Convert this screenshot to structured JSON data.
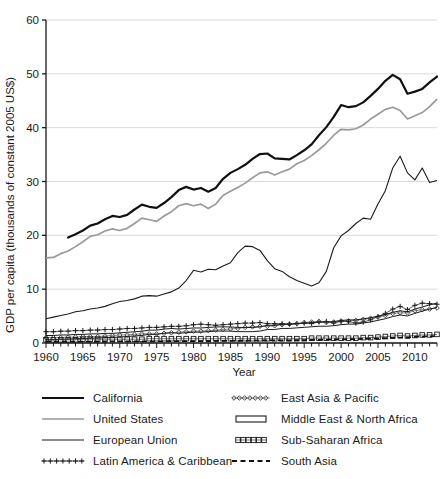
{
  "chart_data": {
    "type": "line",
    "title": "",
    "xlabel": "Year",
    "ylabel": "GDP per capita (thousands of constant 2005 US$)",
    "xlim": [
      1960,
      2013
    ],
    "ylim": [
      0,
      60
    ],
    "yticks": [
      0,
      10,
      20,
      30,
      40,
      50,
      60
    ],
    "xticks": [
      1960,
      1965,
      1970,
      1975,
      1980,
      1985,
      1990,
      1995,
      2000,
      2005,
      2010
    ],
    "xtick_step_minor": 1,
    "grid": "horizontal",
    "legend_position": "below-plot-two-columns",
    "series": [
      {
        "name": "California",
        "style": "solid-thick-black",
        "color": "#111111",
        "x": [
          1963,
          1964,
          1965,
          1966,
          1967,
          1968,
          1969,
          1970,
          1971,
          1972,
          1973,
          1974,
          1975,
          1976,
          1977,
          1978,
          1979,
          1980,
          1981,
          1982,
          1983,
          1984,
          1985,
          1986,
          1987,
          1988,
          1989,
          1990,
          1991,
          1992,
          1993,
          1994,
          1995,
          1996,
          1997,
          1998,
          1999,
          2000,
          2001,
          2002,
          2003,
          2004,
          2005,
          2006,
          2007,
          2008,
          2009,
          2010,
          2011,
          2012,
          2013
        ],
        "values": [
          19.6,
          20.2,
          20.9,
          21.8,
          22.2,
          23.0,
          23.6,
          23.4,
          23.8,
          24.8,
          25.7,
          25.3,
          25.1,
          26.0,
          27.1,
          28.4,
          29.0,
          28.5,
          28.8,
          28.1,
          28.8,
          30.5,
          31.6,
          32.3,
          33.1,
          34.2,
          35.1,
          35.2,
          34.3,
          34.2,
          34.1,
          34.9,
          35.8,
          36.9,
          38.6,
          40.1,
          42.0,
          44.2,
          43.8,
          44.0,
          44.7,
          45.9,
          47.2,
          48.7,
          49.8,
          49.0,
          46.3,
          46.7,
          47.2,
          48.4,
          49.5
        ]
      },
      {
        "name": "United States",
        "style": "solid-gray",
        "color": "#9a9a9a",
        "x": [
          1960,
          1961,
          1962,
          1963,
          1964,
          1965,
          1966,
          1967,
          1968,
          1969,
          1970,
          1971,
          1972,
          1973,
          1974,
          1975,
          1976,
          1977,
          1978,
          1979,
          1980,
          1981,
          1982,
          1983,
          1984,
          1985,
          1986,
          1987,
          1988,
          1989,
          1990,
          1991,
          1992,
          1993,
          1994,
          1995,
          1996,
          1997,
          1998,
          1999,
          2000,
          2001,
          2002,
          2003,
          2004,
          2005,
          2006,
          2007,
          2008,
          2009,
          2010,
          2011,
          2012,
          2013
        ],
        "values": [
          15.8,
          15.9,
          16.6,
          17.1,
          17.9,
          18.8,
          19.8,
          20.1,
          20.8,
          21.2,
          20.9,
          21.3,
          22.2,
          23.2,
          22.9,
          22.6,
          23.6,
          24.4,
          25.5,
          25.9,
          25.5,
          25.8,
          25.0,
          25.8,
          27.4,
          28.2,
          28.9,
          29.7,
          30.7,
          31.6,
          31.8,
          31.2,
          31.8,
          32.3,
          33.3,
          33.9,
          34.8,
          35.9,
          37.1,
          38.6,
          39.7,
          39.6,
          39.8,
          40.5,
          41.6,
          42.5,
          43.4,
          43.8,
          43.2,
          41.6,
          42.2,
          42.8,
          43.9,
          45.3
        ]
      },
      {
        "name": "European Union",
        "style": "solid-thin-black",
        "color": "#1a1a1a",
        "x": [
          1960,
          1961,
          1962,
          1963,
          1964,
          1965,
          1966,
          1967,
          1968,
          1969,
          1970,
          1971,
          1972,
          1973,
          1974,
          1975,
          1976,
          1977,
          1978,
          1979,
          1980,
          1981,
          1982,
          1983,
          1984,
          1985,
          1986,
          1987,
          1988,
          1989,
          1990,
          1991,
          1992,
          1993,
          1994,
          1995,
          1996,
          1997,
          1998,
          1999,
          2000,
          2001,
          2002,
          2003,
          2004,
          2005,
          2006,
          2007,
          2008,
          2009,
          2010,
          2011,
          2012,
          2013
        ],
        "values": [
          4.5,
          4.8,
          5.1,
          5.4,
          5.8,
          6.0,
          6.3,
          6.5,
          6.8,
          7.3,
          7.7,
          7.9,
          8.2,
          8.7,
          8.8,
          8.7,
          9.1,
          9.5,
          10.2,
          11.6,
          13.5,
          13.2,
          13.7,
          13.6,
          14.3,
          14.9,
          16.8,
          18.0,
          17.9,
          17.2,
          15.3,
          13.8,
          13.3,
          12.3,
          11.6,
          11.1,
          10.6,
          11.2,
          13.3,
          17.7,
          19.9,
          20.9,
          22.2,
          23.2,
          23.0,
          25.8,
          28.3,
          32.5,
          34.7,
          31.6,
          30.3,
          32.5,
          29.8,
          30.2
        ]
      },
      {
        "name": "Latin America & Caribbean",
        "style": "plus-markers",
        "color": "#1a1a1a",
        "x": [
          1960,
          1961,
          1962,
          1963,
          1964,
          1965,
          1966,
          1967,
          1968,
          1969,
          1970,
          1971,
          1972,
          1973,
          1974,
          1975,
          1976,
          1977,
          1978,
          1979,
          1980,
          1981,
          1982,
          1983,
          1984,
          1985,
          1986,
          1987,
          1988,
          1989,
          1990,
          1991,
          1992,
          1993,
          1994,
          1995,
          1996,
          1997,
          1998,
          1999,
          2000,
          2001,
          2002,
          2003,
          2004,
          2005,
          2006,
          2007,
          2008,
          2009,
          2010,
          2011,
          2012,
          2013
        ],
        "values": [
          2.1,
          2.1,
          2.2,
          2.2,
          2.3,
          2.3,
          2.4,
          2.4,
          2.5,
          2.5,
          2.6,
          2.7,
          2.7,
          2.8,
          2.9,
          2.9,
          3.0,
          3.1,
          3.1,
          3.2,
          3.4,
          3.5,
          3.4,
          3.3,
          3.4,
          3.5,
          3.6,
          3.7,
          3.7,
          3.8,
          3.6,
          3.6,
          3.6,
          3.5,
          3.6,
          3.7,
          3.6,
          3.9,
          4.0,
          3.7,
          4.0,
          4.0,
          3.7,
          3.9,
          4.3,
          4.9,
          5.5,
          6.3,
          6.8,
          6.2,
          7.0,
          7.4,
          7.3,
          7.2
        ]
      },
      {
        "name": "East Asia & Pacific",
        "style": "diamond-markers",
        "color": "#3a3a3a",
        "x": [
          1960,
          1961,
          1962,
          1963,
          1964,
          1965,
          1966,
          1967,
          1968,
          1969,
          1970,
          1971,
          1972,
          1973,
          1974,
          1975,
          1976,
          1977,
          1978,
          1979,
          1980,
          1981,
          1982,
          1983,
          1984,
          1985,
          1986,
          1987,
          1988,
          1989,
          1990,
          1991,
          1992,
          1993,
          1994,
          1995,
          1996,
          1997,
          1998,
          1999,
          2000,
          2001,
          2002,
          2003,
          2004,
          2005,
          2006,
          2007,
          2008,
          2009,
          2010,
          2011,
          2012,
          2013
        ],
        "values": [
          1.0,
          1.0,
          1.0,
          1.1,
          1.1,
          1.2,
          1.2,
          1.2,
          1.3,
          1.4,
          1.5,
          1.5,
          1.6,
          1.7,
          1.7,
          1.7,
          1.8,
          1.9,
          2.0,
          2.1,
          2.2,
          2.2,
          2.3,
          2.4,
          2.5,
          2.6,
          2.7,
          2.9,
          3.0,
          3.1,
          3.1,
          3.2,
          3.4,
          3.5,
          3.6,
          3.8,
          3.9,
          4.0,
          3.8,
          3.9,
          4.1,
          4.1,
          4.2,
          4.4,
          4.6,
          4.8,
          5.1,
          5.5,
          5.6,
          5.6,
          6.0,
          6.2,
          6.3,
          6.5
        ]
      },
      {
        "name": "Middle East & North Africa",
        "style": "hollow-bar",
        "color": "#1a1a1a",
        "x": [
          1960,
          1961,
          1962,
          1963,
          1964,
          1965,
          1966,
          1967,
          1968,
          1969,
          1970,
          1971,
          1972,
          1973,
          1974,
          1975,
          1976,
          1977,
          1978,
          1979,
          1980,
          1981,
          1982,
          1983,
          1984,
          1985,
          1986,
          1987,
          1988,
          1989,
          1990,
          1991,
          1992,
          1993,
          1994,
          1995,
          1996,
          1997,
          1998,
          1999,
          2000,
          2001,
          2002,
          2003,
          2004,
          2005,
          2006,
          2007,
          2008,
          2009,
          2010,
          2011,
          2012,
          2013
        ],
        "values": [
          1.0,
          1.0,
          1.1,
          1.1,
          1.2,
          1.2,
          1.3,
          1.3,
          1.4,
          1.4,
          1.5,
          1.6,
          1.7,
          1.8,
          2.0,
          2.0,
          2.2,
          2.3,
          2.2,
          2.3,
          2.4,
          2.4,
          2.5,
          2.6,
          2.6,
          2.6,
          2.5,
          2.5,
          2.5,
          2.6,
          2.9,
          2.9,
          3.1,
          3.1,
          3.2,
          3.3,
          3.4,
          3.5,
          3.5,
          3.6,
          3.8,
          3.9,
          3.9,
          4.1,
          4.3,
          4.6,
          4.9,
          5.3,
          5.6,
          5.4,
          5.9,
          6.3,
          6.7,
          7.0
        ]
      },
      {
        "name": "Sub-Saharan Africa",
        "style": "square-markers",
        "color": "#1a1a1a",
        "x": [
          1960,
          1961,
          1962,
          1963,
          1964,
          1965,
          1966,
          1967,
          1968,
          1969,
          1970,
          1971,
          1972,
          1973,
          1974,
          1975,
          1976,
          1977,
          1978,
          1979,
          1980,
          1981,
          1982,
          1983,
          1984,
          1985,
          1986,
          1987,
          1988,
          1989,
          1990,
          1991,
          1992,
          1993,
          1994,
          1995,
          1996,
          1997,
          1998,
          1999,
          2000,
          2001,
          2002,
          2003,
          2004,
          2005,
          2006,
          2007,
          2008,
          2009,
          2010,
          2011,
          2012,
          2013
        ],
        "values": [
          0.6,
          0.6,
          0.6,
          0.6,
          0.6,
          0.7,
          0.7,
          0.7,
          0.7,
          0.7,
          0.7,
          0.7,
          0.7,
          0.7,
          0.8,
          0.8,
          0.8,
          0.8,
          0.8,
          0.8,
          0.8,
          0.8,
          0.8,
          0.8,
          0.8,
          0.8,
          0.8,
          0.8,
          0.8,
          0.8,
          0.8,
          0.8,
          0.8,
          0.8,
          0.8,
          0.8,
          0.9,
          0.9,
          0.9,
          0.9,
          0.9,
          0.9,
          0.9,
          1.0,
          1.0,
          1.1,
          1.2,
          1.3,
          1.4,
          1.3,
          1.4,
          1.5,
          1.5,
          1.6
        ]
      },
      {
        "name": "South Asia",
        "style": "dashed",
        "color": "#111111",
        "x": [
          1960,
          1961,
          1962,
          1963,
          1964,
          1965,
          1966,
          1967,
          1968,
          1969,
          1970,
          1971,
          1972,
          1973,
          1974,
          1975,
          1976,
          1977,
          1978,
          1979,
          1980,
          1981,
          1982,
          1983,
          1984,
          1985,
          1986,
          1987,
          1988,
          1989,
          1990,
          1991,
          1992,
          1993,
          1994,
          1995,
          1996,
          1997,
          1998,
          1999,
          2000,
          2001,
          2002,
          2003,
          2004,
          2005,
          2006,
          2007,
          2008,
          2009,
          2010,
          2011,
          2012,
          2013
        ],
        "values": [
          0.25,
          0.25,
          0.25,
          0.26,
          0.27,
          0.27,
          0.27,
          0.28,
          0.28,
          0.29,
          0.3,
          0.3,
          0.3,
          0.31,
          0.31,
          0.32,
          0.32,
          0.33,
          0.34,
          0.34,
          0.35,
          0.36,
          0.37,
          0.38,
          0.39,
          0.4,
          0.41,
          0.42,
          0.44,
          0.46,
          0.47,
          0.47,
          0.49,
          0.5,
          0.52,
          0.55,
          0.57,
          0.59,
          0.62,
          0.65,
          0.67,
          0.69,
          0.71,
          0.75,
          0.8,
          0.85,
          0.91,
          0.97,
          1.0,
          1.06,
          1.14,
          1.19,
          1.23,
          1.28
        ]
      }
    ]
  },
  "legend": {
    "items": [
      {
        "label": "California",
        "style": "solid-thick-black",
        "column": "left"
      },
      {
        "label": "United States",
        "style": "solid-gray",
        "column": "left"
      },
      {
        "label": "European Union",
        "style": "solid-thin-black",
        "column": "left"
      },
      {
        "label": "Latin America & Caribbean",
        "style": "plus-markers",
        "column": "left"
      },
      {
        "label": "East Asia & Pacific",
        "style": "diamond-markers",
        "column": "right"
      },
      {
        "label": "Middle East & North Africa",
        "style": "hollow-bar",
        "column": "right"
      },
      {
        "label": "Sub-Saharan Africa",
        "style": "square-markers",
        "column": "right"
      },
      {
        "label": "South Asia",
        "style": "dashed",
        "column": "right"
      }
    ]
  },
  "axes": {
    "x_title": "Year",
    "y_title": "GDP per capita (thousands of constant 2005 US$)",
    "y_tick_labels": [
      "0",
      "10",
      "20",
      "30",
      "40",
      "50",
      "60"
    ],
    "x_tick_labels": [
      "1960",
      "1965",
      "1970",
      "1975",
      "1980",
      "1985",
      "1990",
      "1995",
      "2000",
      "2005",
      "2010"
    ]
  },
  "colors": {
    "grid": "#d9d9d9",
    "axis": "#1a1a1a",
    "california": "#111111",
    "united_states": "#9a9a9a",
    "european_union": "#1a1a1a",
    "background": "#ffffff"
  }
}
